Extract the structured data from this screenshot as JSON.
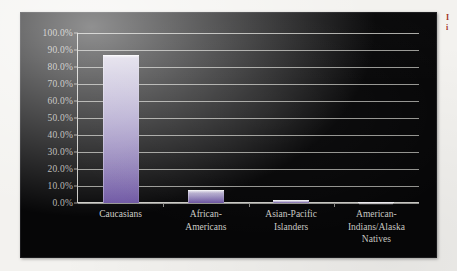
{
  "chart_data": {
    "type": "bar",
    "title": "",
    "xlabel": "",
    "ylabel": "",
    "categories": [
      "Caucasians",
      "African-\nAmericans",
      "Asian-Pacific\nIslanders",
      "American-\nIndians/Alaska\nNatives"
    ],
    "values": [
      87.0,
      7.5,
      2.0,
      0.5
    ],
    "value_labels": [
      "87.0%",
      "7.5%",
      "2.0%",
      "0.5%"
    ],
    "ylim": [
      0,
      100
    ],
    "ytick_values": [
      100,
      90,
      80,
      70,
      60,
      50,
      40,
      30,
      20,
      10,
      0
    ],
    "ytick_labels": [
      "100.0%",
      "90.0%",
      "80.0%",
      "70.0%",
      "60.0%",
      "50.0%",
      "40.0%",
      "30.0%",
      "20.0%",
      "10.0%",
      "0.0%"
    ],
    "grid": true,
    "legend": false,
    "legend_position": "none",
    "series": [
      {
        "name": "",
        "values": [
          87.0,
          7.5,
          2.0,
          0.5
        ]
      }
    ],
    "annotations": []
  },
  "colors": {
    "plot_background": "#060607",
    "page_background": "#f3f2ef",
    "gridline": "#b9b8b4",
    "axis": "#cfcec9",
    "tick_text": "#d8d7d2",
    "label_text": "#d3d2cd",
    "bar_top": "#d5d0e2",
    "bar_bottom": "#6e56a4",
    "edge_note": "#a33227"
  },
  "edge_note": {
    "line1": "I",
    "line2": "i"
  }
}
